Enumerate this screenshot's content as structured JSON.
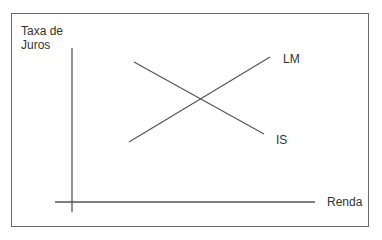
{
  "diagram": {
    "y_axis_label_line1": "Taxa de",
    "y_axis_label_line2": "Juros",
    "x_axis_label": "Renda",
    "curves": [
      {
        "name": "LM",
        "slope": "upward",
        "from": [
          129,
          142
        ],
        "to": [
          270,
          57
        ]
      },
      {
        "name": "IS",
        "slope": "downward",
        "from": [
          134,
          62
        ],
        "to": [
          264,
          134
        ]
      }
    ],
    "colors": {
      "line": "#555555",
      "text": "#333333",
      "frame": "#6a6a6a"
    }
  }
}
